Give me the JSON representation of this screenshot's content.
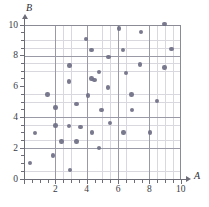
{
  "chart": {
    "type_label": "scatter-plot"
  },
  "axis": {
    "x_title": "A",
    "y_title": "B",
    "x_ticks": [
      "2",
      "4",
      "6",
      "8",
      "10"
    ],
    "y_ticks": [
      "0",
      "2",
      "4",
      "6",
      "8",
      "10"
    ]
  },
  "chart_data": {
    "type": "scatter",
    "title": "",
    "xlabel": "A",
    "ylabel": "B",
    "xlim": [
      0,
      10
    ],
    "ylim": [
      0,
      10
    ],
    "xticks": [
      0,
      2,
      4,
      6,
      8,
      10
    ],
    "yticks": [
      0,
      2,
      4,
      6,
      8,
      10
    ],
    "grid": true,
    "minor_grid_step": 0.5,
    "legend": null,
    "series": [
      {
        "name": "points",
        "marker": "circle",
        "color": "#6f6f86",
        "points": [
          [
            0.4,
            1.0
          ],
          [
            0.7,
            2.95
          ],
          [
            1.5,
            5.45
          ],
          [
            1.85,
            1.5
          ],
          [
            2.0,
            3.45
          ],
          [
            2.0,
            4.6
          ],
          [
            2.4,
            2.4
          ],
          [
            2.85,
            3.4
          ],
          [
            2.85,
            6.3
          ],
          [
            2.9,
            7.35
          ],
          [
            2.95,
            0.55
          ],
          [
            3.35,
            2.4
          ],
          [
            3.35,
            4.85
          ],
          [
            3.6,
            3.35
          ],
          [
            3.95,
            9.05
          ],
          [
            4.1,
            5.4
          ],
          [
            4.3,
            8.35
          ],
          [
            4.3,
            6.5
          ],
          [
            4.35,
            3.0
          ],
          [
            4.5,
            6.4
          ],
          [
            4.8,
            6.9
          ],
          [
            4.8,
            2.0
          ],
          [
            4.95,
            4.45
          ],
          [
            5.35,
            5.9
          ],
          [
            5.4,
            7.9
          ],
          [
            5.5,
            3.6
          ],
          [
            6.05,
            9.75
          ],
          [
            6.3,
            8.35
          ],
          [
            6.35,
            3.0
          ],
          [
            6.5,
            6.85
          ],
          [
            6.85,
            5.45
          ],
          [
            6.9,
            4.45
          ],
          [
            7.4,
            7.4
          ],
          [
            7.45,
            9.5
          ],
          [
            8.05,
            3.0
          ],
          [
            8.5,
            5.05
          ],
          [
            8.95,
            10.05
          ],
          [
            8.95,
            7.2
          ],
          [
            9.4,
            8.4
          ]
        ]
      }
    ]
  }
}
